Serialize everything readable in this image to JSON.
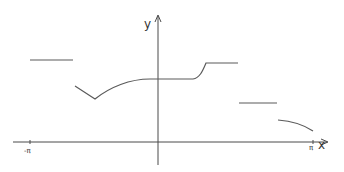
{
  "diagram": {
    "type": "piecewise-function-sketch",
    "colors": {
      "axis": "#4a4a4a",
      "curve": "#5a5a5a",
      "background": "#ffffff"
    },
    "axes": {
      "x_label": "x",
      "y_label": "y",
      "ticks": [
        {
          "label": "-π",
          "position": "-pi"
        },
        {
          "label": "π",
          "position": "pi"
        }
      ]
    },
    "pieces": [
      {
        "id": "piece-1",
        "shape": "horizontal segment",
        "x_range": [
          "-π",
          "-π/2 approx"
        ],
        "level": "high"
      },
      {
        "id": "piece-2",
        "shape": "V dip then rising curve to flat plateau through y-axis, rising to higher flat",
        "x_range": [
          "-π/2 approx",
          "π/2 approx"
        ]
      },
      {
        "id": "piece-3",
        "shape": "horizontal segment",
        "level": "middle-low"
      },
      {
        "id": "piece-4",
        "shape": "decreasing concave curve ending at π",
        "level": "low"
      }
    ]
  }
}
